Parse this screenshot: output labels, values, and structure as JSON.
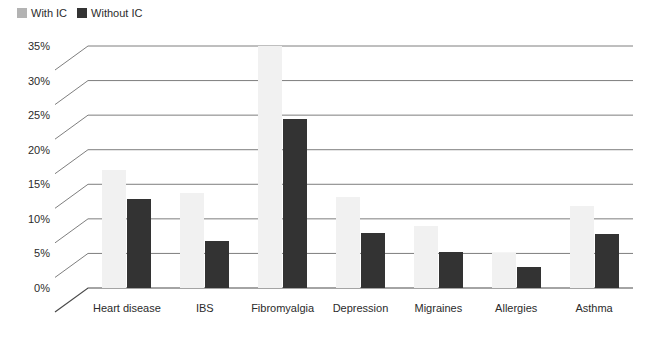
{
  "legend": {
    "entries": [
      {
        "label": "With IC",
        "color": "#b3b3b3"
      },
      {
        "label": "Without IC",
        "color": "#333333"
      }
    ]
  },
  "axes": {
    "y_ticks": [
      "0%",
      "5%",
      "10%",
      "15%",
      "20%",
      "25%",
      "30%",
      "35%"
    ]
  },
  "chart_data": {
    "type": "bar",
    "title": "",
    "xlabel": "",
    "ylabel": "",
    "ylim": [
      0,
      35
    ],
    "ytick_step": 5,
    "grid": true,
    "legend_position": "top-left",
    "categories": [
      "Heart disease",
      "IBS",
      "Fibromyalgia",
      "Depression",
      "Migraines",
      "Allergies",
      "Asthma"
    ],
    "series": [
      {
        "name": "With IC",
        "color": "#f1f1f1",
        "values": [
          17.0,
          13.8,
          35.0,
          13.2,
          9.0,
          5.0,
          11.8
        ]
      },
      {
        "name": "Without IC",
        "color": "#333333",
        "values": [
          12.9,
          6.8,
          24.5,
          7.9,
          5.2,
          3.0,
          7.8
        ]
      }
    ]
  }
}
